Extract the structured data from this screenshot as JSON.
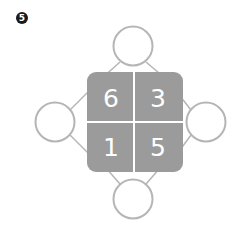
{
  "problem": {
    "number": "5"
  },
  "grid": {
    "cells": [
      {
        "value": "6",
        "position": "top-left"
      },
      {
        "value": "3",
        "position": "top-right"
      },
      {
        "value": "1",
        "position": "bottom-left"
      },
      {
        "value": "5",
        "position": "bottom-right"
      }
    ],
    "fill_color": "#9b9b9b",
    "divider_color": "#ffffff"
  },
  "circles": [
    {
      "position": "top",
      "value": ""
    },
    {
      "position": "left",
      "value": ""
    },
    {
      "position": "right",
      "value": ""
    },
    {
      "position": "bottom",
      "value": ""
    }
  ],
  "colors": {
    "stroke": "#b5b5b5"
  }
}
